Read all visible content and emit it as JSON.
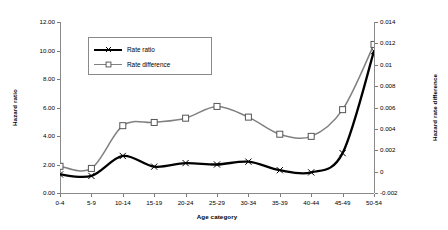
{
  "chart_data": {
    "type": "line",
    "title": "",
    "xlabel": "Age category",
    "categories": [
      "0-4",
      "5-9",
      "10-14",
      "15-19",
      "20-24",
      "25-29",
      "30-34",
      "35-39",
      "40-44",
      "45-49",
      "50-54"
    ],
    "grid": false,
    "legend_position": "upper-left-inside",
    "axes": {
      "left": {
        "label": "Hazard ratio",
        "ylim": [
          0.0,
          12.0
        ],
        "ticks": [
          0.0,
          2.0,
          4.0,
          6.0,
          8.0,
          10.0,
          12.0
        ],
        "tick_labels": [
          "0.00",
          "2.00",
          "4.00",
          "6.00",
          "8.00",
          "10.00",
          "12.00"
        ]
      },
      "right": {
        "label": "Hazard rate difference",
        "ylim": [
          -0.002,
          0.014
        ],
        "ticks": [
          -0.002,
          0,
          0.002,
          0.004,
          0.006,
          0.008,
          0.01,
          0.012,
          0.014
        ],
        "tick_labels": [
          "-0.002",
          "0",
          "0.002",
          "0.004",
          "0.006",
          "0.008",
          "0.01",
          "0.012",
          "0.014"
        ]
      }
    },
    "series": [
      {
        "name": "Rate ratio",
        "axis": "left",
        "color": "#000000",
        "marker": "x",
        "values": [
          1.3,
          1.2,
          2.6,
          1.85,
          2.1,
          2.0,
          2.2,
          1.6,
          1.45,
          2.8,
          9.95
        ]
      },
      {
        "name": "Rate difference",
        "axis": "right",
        "color": "#808080",
        "marker": "open-square",
        "values": [
          0.0005,
          0.0003,
          0.0043,
          0.0046,
          0.005,
          0.0061,
          0.0051,
          0.0035,
          0.0033,
          0.0058,
          0.0119
        ]
      }
    ]
  },
  "legend": {
    "items": [
      {
        "label": "Rate ratio"
      },
      {
        "label": "Rate difference"
      }
    ]
  }
}
